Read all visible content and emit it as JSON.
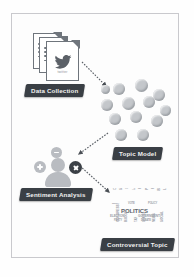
{
  "diagram": {
    "frame_color": "#c9c9cd",
    "background": "#fdfdfd",
    "label_bg": "#3a3f45",
    "label_fg": "#f2f2f2",
    "accent_dark": "#3b4046",
    "bubble_color": "#c4c7cb",
    "person_color": "#b9bcc1",
    "stages": [
      {
        "id": "data-collection",
        "label": "Data Collection",
        "icon": "stacked-documents-twitter-icon",
        "source_name": "twitter"
      },
      {
        "id": "topic-model",
        "label": "Topic Model",
        "icon": "bubble-cluster-icon",
        "bubble_count": 13
      },
      {
        "id": "sentiment-analysis",
        "label": "Sentiment Analysis",
        "icon": "person-with-sentiment-badges-icon",
        "badges": [
          "minus",
          "plus",
          "cross"
        ]
      },
      {
        "id": "controversial-topic",
        "label": "Controversial Topic",
        "icon": "word-cloud-icon",
        "main_word": "POLITICS"
      }
    ],
    "arrows": [
      {
        "id": "arrow-collection-to-topic",
        "from": "data-collection",
        "to": "topic-model",
        "style": "dashed"
      },
      {
        "id": "arrow-topic-to-sentiment",
        "from": "topic-model",
        "to": "sentiment-analysis",
        "style": "dashed"
      },
      {
        "id": "arrow-sentiment-to-controversial",
        "from": "sentiment-analysis",
        "to": "controversial-topic",
        "style": "dashed"
      }
    ],
    "bubbles": [
      {
        "x": 12,
        "y": 4,
        "d": 12
      },
      {
        "x": 34,
        "y": 0,
        "d": 13
      },
      {
        "x": 52,
        "y": 10,
        "d": 12
      },
      {
        "x": 0,
        "y": 20,
        "d": 12
      },
      {
        "x": 21,
        "y": 18,
        "d": 13
      },
      {
        "x": 42,
        "y": 17,
        "d": 12
      },
      {
        "x": 59,
        "y": 26,
        "d": 11
      },
      {
        "x": 8,
        "y": 34,
        "d": 12
      },
      {
        "x": 29,
        "y": 32,
        "d": 12
      },
      {
        "x": 50,
        "y": 36,
        "d": 12
      },
      {
        "x": 14,
        "y": 50,
        "d": 12
      },
      {
        "x": 36,
        "y": 50,
        "d": 12
      },
      {
        "x": 0,
        "y": 6,
        "d": 9
      }
    ],
    "cloud_words": [
      {
        "t": "POLITICS",
        "s": 6.0,
        "x": 13,
        "y": 20,
        "r": false,
        "big": true
      },
      {
        "t": "ELECTION",
        "s": 3.0,
        "x": 2,
        "y": 26,
        "r": false,
        "big": false
      },
      {
        "t": "GOVERNMENT",
        "s": 3.2,
        "x": 30,
        "y": 26,
        "r": false,
        "big": false
      },
      {
        "t": "PARTY",
        "s": 2.6,
        "x": 6,
        "y": 31,
        "r": false,
        "big": false
      },
      {
        "t": "DEBATE",
        "s": 2.6,
        "x": 33,
        "y": 31,
        "r": false,
        "big": false
      },
      {
        "t": "VOTE",
        "s": 2.6,
        "x": 20,
        "y": 14,
        "r": false,
        "big": false
      },
      {
        "t": "POLICY",
        "s": 2.6,
        "x": 40,
        "y": 14,
        "r": false,
        "big": false
      },
      {
        "t": "MEDIA",
        "s": 2.4,
        "x": 4,
        "y": 14,
        "r": false,
        "big": false
      },
      {
        "t": "CAMPAIGN",
        "s": 3.4,
        "x": 5,
        "y": 2,
        "r": true,
        "big": false
      },
      {
        "t": "SENATE",
        "s": 3.0,
        "x": 11,
        "y": 2,
        "r": true,
        "big": false
      },
      {
        "t": "OPINION",
        "s": 3.4,
        "x": 17,
        "y": 1,
        "r": true,
        "big": false
      },
      {
        "t": "LAW",
        "s": 2.8,
        "x": 24,
        "y": 2,
        "r": true,
        "big": false
      },
      {
        "t": "REFORM",
        "s": 3.2,
        "x": 30,
        "y": 1,
        "r": true,
        "big": false
      },
      {
        "t": "PUBLIC",
        "s": 3.0,
        "x": 37,
        "y": 2,
        "r": true,
        "big": false
      },
      {
        "t": "RIGHTS",
        "s": 3.2,
        "x": 43,
        "y": 1,
        "r": true,
        "big": false
      },
      {
        "t": "ISSUE",
        "s": 2.8,
        "x": 49,
        "y": 3,
        "r": true,
        "big": false
      },
      {
        "t": "LEADER",
        "s": 3.0,
        "x": 55,
        "y": 2,
        "r": true,
        "big": false
      },
      {
        "t": "CONGRESS",
        "s": 3.2,
        "x": 8,
        "y": 34,
        "r": true,
        "big": false
      },
      {
        "t": "BUDGET",
        "s": 3.0,
        "x": 16,
        "y": 34,
        "r": true,
        "big": false
      },
      {
        "t": "TAX",
        "s": 2.8,
        "x": 26,
        "y": 34,
        "r": true,
        "big": false
      },
      {
        "t": "STATE",
        "s": 3.0,
        "x": 34,
        "y": 34,
        "r": true,
        "big": false
      },
      {
        "t": "NEWS",
        "s": 3.0,
        "x": 44,
        "y": 34,
        "r": true,
        "big": false
      },
      {
        "t": "SOCIAL",
        "s": 3.0,
        "x": 52,
        "y": 34,
        "r": true,
        "big": false
      }
    ]
  }
}
